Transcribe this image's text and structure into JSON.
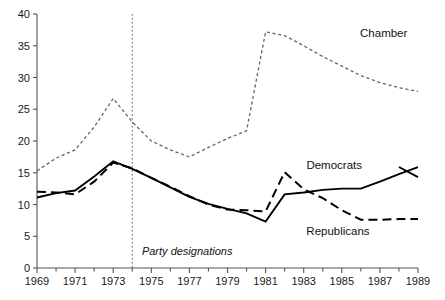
{
  "chart_data": {
    "type": "line",
    "title": "",
    "subtitle": "",
    "xlabel": "",
    "ylabel": "",
    "xlim": [
      1969,
      1989
    ],
    "ylim": [
      0,
      40
    ],
    "grid": false,
    "legend_position": "inline-annotations",
    "y_ticks": [
      0,
      5,
      10,
      15,
      20,
      25,
      30,
      35,
      40
    ],
    "y_tick_labels": [
      "0",
      "5",
      "10",
      "15",
      "20",
      "25",
      "30",
      "35",
      "40"
    ],
    "x_ticks": [
      1969,
      1970,
      1971,
      1972,
      1973,
      1974,
      1975,
      1976,
      1977,
      1978,
      1979,
      1980,
      1981,
      1982,
      1983,
      1984,
      1985,
      1986,
      1987,
      1988,
      1989
    ],
    "x_tick_labels": [
      "1969",
      "",
      "1971",
      "",
      "1973",
      "",
      "1975",
      "",
      "1977",
      "",
      "1979",
      "",
      "1981",
      "",
      "1983",
      "",
      "1985",
      "",
      "1987",
      "",
      "1989"
    ],
    "x": [
      1969,
      1970,
      1971,
      1972,
      1973,
      1974,
      1975,
      1976,
      1977,
      1978,
      1979,
      1980,
      1981,
      1982,
      1983,
      1984,
      1985,
      1986,
      1987,
      1988,
      1989
    ],
    "series": [
      {
        "name": "Chamber",
        "style": "dotted",
        "color": "#666666",
        "label": "Chamber",
        "label_x": 1987.2,
        "label_y": 36.3,
        "values": [
          15.3,
          17.3,
          18.6,
          22.2,
          26.7,
          23.0,
          20.0,
          18.6,
          17.5,
          19.0,
          20.4,
          21.6,
          37.2,
          36.6,
          35.0,
          33.3,
          31.8,
          30.3,
          29.2,
          28.4,
          27.8
        ]
      },
      {
        "name": "Democrats",
        "style": "solid",
        "color": "#000000",
        "label": "Democrats",
        "label_x": 1984.6,
        "label_y": 15.6,
        "values": [
          11.1,
          11.8,
          12.2,
          14.4,
          16.8,
          15.6,
          14.2,
          12.7,
          11.2,
          10.1,
          9.3,
          8.6,
          7.3,
          11.6,
          11.9,
          12.3,
          12.5,
          12.5,
          13.6,
          14.8,
          15.9
        ]
      },
      {
        "name": "Republicans",
        "style": "dashed",
        "color": "#000000",
        "label": "Republicans",
        "label_x": 1984.8,
        "label_y": 5.2,
        "values": [
          12.0,
          11.9,
          11.6,
          13.6,
          16.6,
          15.7,
          14.2,
          12.8,
          11.3,
          10.0,
          9.2,
          9.1,
          8.9,
          15.1,
          12.4,
          11.0,
          9.1,
          7.6,
          7.6,
          7.7,
          7.7
        ]
      }
    ],
    "annotations": [
      {
        "name": "party-designations",
        "text": "Party designations",
        "type": "vertical-rule-with-label",
        "x": 1974,
        "label_x": 1974.35,
        "label_y": 2.0
      }
    ],
    "democrats_tail": {
      "note": "Democrats line continues from 1988 peak down to 1989",
      "x": [
        1988,
        1989
      ],
      "values": [
        15.9,
        14.3
      ]
    }
  }
}
